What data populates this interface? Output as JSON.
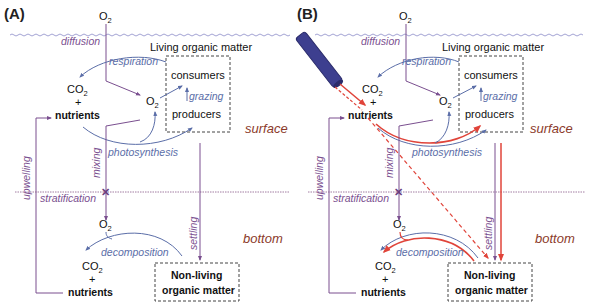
{
  "panels": [
    {
      "id": "A",
      "label": "(A)",
      "o2_top": "O",
      "living_title": "Living  organic matter",
      "consumers": "consumers",
      "producers": "producers",
      "co2_surface": "CO",
      "plus_surface": "+",
      "nutrients_surface": "nutrients",
      "o2_mid": "O",
      "o2_bottom": "O",
      "co2_bottom": "CO",
      "plus_bottom": "+",
      "nutrients_bottom": "nutrients",
      "nonliving_line1": "Non-living",
      "nonliving_line2": "organic matter",
      "processes": {
        "diffusion": "diffusion",
        "respiration": "respiration",
        "grazing": "grazing",
        "photosynthesis": "photosynthesis",
        "mixing": "mixing",
        "stratification": "stratification",
        "upwelling": "upwelling",
        "settling": "settling",
        "decomposition": "decomposition"
      },
      "zones": {
        "surface": "surface",
        "bottom": "bottom"
      }
    },
    {
      "id": "B",
      "label": "(B)",
      "o2_top": "O",
      "living_title": "Living  organic matter",
      "consumers": "consumers",
      "producers": "producers",
      "co2_surface": "CO",
      "plus_surface": "+",
      "nutrients_surface": "nutrients",
      "o2_mid": "O",
      "o2_bottom": "O",
      "co2_bottom": "CO",
      "plus_bottom": "+",
      "nutrients_bottom": "nutrients",
      "nonliving_line1": "Non-living",
      "nonliving_line2": "organic matter",
      "processes": {
        "diffusion": "diffusion",
        "respiration": "respiration",
        "grazing": "grazing",
        "photosynthesis": "photosynthesis",
        "mixing": "mixing",
        "stratification": "stratification",
        "upwelling": "upwelling",
        "settling": "settling",
        "decomposition": "decomposition"
      },
      "zones": {
        "surface": "surface",
        "bottom": "bottom"
      },
      "pipe": "discharge-pipe-icon"
    }
  ],
  "subscript": "2",
  "colors": {
    "purple": "#7a4f8f",
    "blue": "#5b6ea8",
    "red": "#e0443a",
    "zone": "#8b3a2a",
    "pipe": "#3d3f8f",
    "water_surface": "#8a8ac8",
    "strat_line": "#8a5a8a"
  }
}
